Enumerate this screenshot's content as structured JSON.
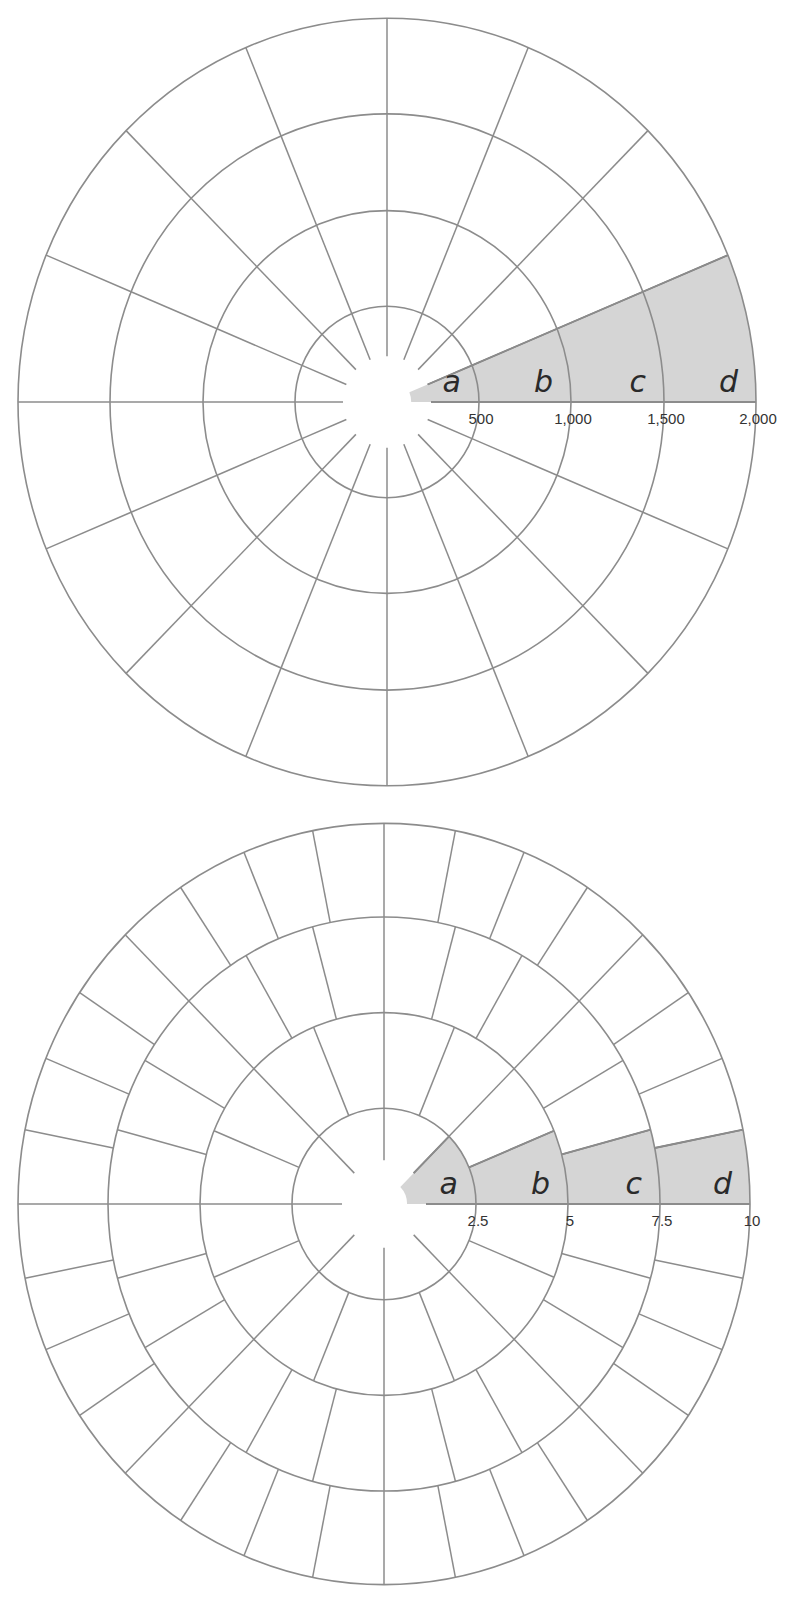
{
  "colors": {
    "line": "#8c8c8c",
    "shade": "#d5d5d5",
    "text": "#333333",
    "background": "#ffffff"
  },
  "diagrams": [
    {
      "id": "top",
      "title": "Polar diagram with equal angular sectors",
      "center": [
        387,
        402
      ],
      "ring_radii_px": [
        92,
        184,
        277,
        369
      ],
      "vertical_scale": 1.04,
      "inner_gap_px": 44,
      "ring_letters": [
        "a",
        "b",
        "c",
        "d"
      ],
      "tick_labels": [
        "500",
        "1,000",
        "1,500",
        "2,000"
      ],
      "sectors_per_ring": [
        16,
        16,
        16,
        16
      ],
      "sector_angle_deg": [
        22.5,
        22.5,
        22.5,
        22.5
      ],
      "shaded_sector_deg": [
        22.5,
        22.5,
        22.5,
        22.5
      ]
    },
    {
      "id": "bottom",
      "title": "Polar diagram with sectors subdivided per ring",
      "center": [
        384,
        404
      ],
      "ring_radii_px": [
        92,
        184,
        276,
        366
      ],
      "vertical_scale": 1.04,
      "inner_gap_px": 42,
      "ring_letters": [
        "a",
        "b",
        "c",
        "d"
      ],
      "tick_labels": [
        "2.5",
        "5",
        "7.5",
        "10"
      ],
      "sectors_per_ring": [
        8,
        16,
        24,
        32
      ],
      "sector_angle_deg": [
        45,
        22.5,
        15,
        11.25
      ],
      "shaded_sector_deg": [
        45,
        22.5,
        15,
        11.25
      ]
    }
  ],
  "chart_data": [
    {
      "type": "polar-grid",
      "title": "",
      "radial_axis": {
        "ticks": [
          500,
          1000,
          1500,
          2000
        ],
        "tick_labels": [
          "500",
          "1,000",
          "1,500",
          "2,000"
        ],
        "range": [
          0,
          2000
        ]
      },
      "rings": [
        "a",
        "b",
        "c",
        "d"
      ],
      "angular_divisions": 16,
      "angular_step_deg": 22.5,
      "highlighted_cells": [
        {
          "ring": "a",
          "r_range": [
            0,
            500
          ],
          "theta_range_deg": [
            0,
            22.5
          ]
        },
        {
          "ring": "b",
          "r_range": [
            500,
            1000
          ],
          "theta_range_deg": [
            0,
            22.5
          ]
        },
        {
          "ring": "c",
          "r_range": [
            1000,
            1500
          ],
          "theta_range_deg": [
            0,
            22.5
          ]
        },
        {
          "ring": "d",
          "r_range": [
            1500,
            2000
          ],
          "theta_range_deg": [
            0,
            22.5
          ]
        }
      ]
    },
    {
      "type": "polar-grid",
      "title": "",
      "radial_axis": {
        "ticks": [
          2.5,
          5,
          7.5,
          10
        ],
        "tick_labels": [
          "2.5",
          "5",
          "7.5",
          "10"
        ],
        "range": [
          0,
          10
        ]
      },
      "rings": [
        "a",
        "b",
        "c",
        "d"
      ],
      "angular_divisions_per_ring": [
        8,
        16,
        24,
        32
      ],
      "angular_step_deg_per_ring": [
        45,
        22.5,
        15,
        11.25
      ],
      "highlighted_cells": [
        {
          "ring": "a",
          "r_range": [
            0,
            2.5
          ],
          "theta_range_deg": [
            0,
            45
          ]
        },
        {
          "ring": "b",
          "r_range": [
            2.5,
            5
          ],
          "theta_range_deg": [
            0,
            22.5
          ]
        },
        {
          "ring": "c",
          "r_range": [
            5,
            7.5
          ],
          "theta_range_deg": [
            0,
            15
          ]
        },
        {
          "ring": "d",
          "r_range": [
            7.5,
            10
          ],
          "theta_range_deg": [
            0,
            11.25
          ]
        }
      ]
    }
  ]
}
